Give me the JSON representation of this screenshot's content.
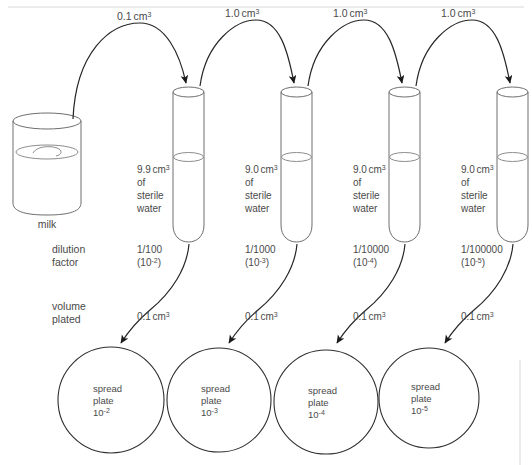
{
  "diagram": {
    "source_vessel": {
      "label": "milk"
    },
    "side_labels": {
      "dilution_factor_line1": "dilution",
      "dilution_factor_line2": "factor",
      "volume_plated_line1": "volume",
      "volume_plated_line2": "plated"
    },
    "transfers": [
      {
        "volume": "0.1",
        "unit": "cm",
        "exponent": "3"
      },
      {
        "volume": "1.0",
        "unit": "cm",
        "exponent": "3"
      },
      {
        "volume": "1.0",
        "unit": "cm",
        "exponent": "3"
      },
      {
        "volume": "1.0",
        "unit": "cm",
        "exponent": "3"
      }
    ],
    "tubes": [
      {
        "contents_volume": "9.9",
        "contents_unit": "cm",
        "contents_exponent": "3",
        "contents_line2": "of",
        "contents_line3": "sterile",
        "contents_line4": "water",
        "dilution_fraction": "1/100",
        "dilution_power_base": "(10",
        "dilution_power_exp": "-2",
        "dilution_power_close": ")",
        "plated_volume": "0.1",
        "plated_unit": "cm",
        "plated_exponent": "3"
      },
      {
        "contents_volume": "9.0",
        "contents_unit": "cm",
        "contents_exponent": "3",
        "contents_line2": "of",
        "contents_line3": "sterile",
        "contents_line4": "water",
        "dilution_fraction": "1/1000",
        "dilution_power_base": "(10",
        "dilution_power_exp": "-3",
        "dilution_power_close": ")",
        "plated_volume": "0.1",
        "plated_unit": "cm",
        "plated_exponent": "3"
      },
      {
        "contents_volume": "9.0",
        "contents_unit": "cm",
        "contents_exponent": "3",
        "contents_line2": "of",
        "contents_line3": "sterile",
        "contents_line4": "water",
        "dilution_fraction": "1/10000",
        "dilution_power_base": "(10",
        "dilution_power_exp": "-4",
        "dilution_power_close": ")",
        "plated_volume": "0.1",
        "plated_unit": "cm",
        "plated_exponent": "3"
      },
      {
        "contents_volume": "9.0",
        "contents_unit": "cm",
        "contents_exponent": "3",
        "contents_line2": "of",
        "contents_line3": "sterile",
        "contents_line4": "water",
        "dilution_fraction": "1/100000",
        "dilution_power_base": "(10",
        "dilution_power_exp": "-5",
        "dilution_power_close": ")",
        "plated_volume": "0.1",
        "plated_unit": "cm",
        "plated_exponent": "3"
      }
    ],
    "plates": [
      {
        "line1": "spread",
        "line2": "plate",
        "base": "10",
        "exponent": "-2"
      },
      {
        "line1": "spread",
        "line2": "plate",
        "base": "10",
        "exponent": "-3"
      },
      {
        "line1": "spread",
        "line2": "plate",
        "base": "10",
        "exponent": "-4"
      },
      {
        "line1": "spread",
        "line2": "plate",
        "base": "10",
        "exponent": "-5"
      }
    ],
    "colors": {
      "background": "#ffffff",
      "ink": "#3a3a3a",
      "glass": "#6e6e6e",
      "text": "#4a4a4a",
      "arrow": "#1a1a1a"
    }
  }
}
